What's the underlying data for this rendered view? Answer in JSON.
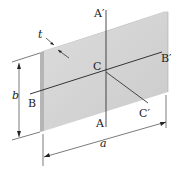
{
  "diagram": {
    "labels": {
      "a_prime": "A′",
      "a": "A",
      "b_prime": "B′",
      "b_axis": "B",
      "c": "C",
      "c_prime": "C′",
      "thickness": "t",
      "height_dim": "b",
      "width_dim": "a"
    },
    "colors": {
      "plate_face": "#d4d4d4",
      "plate_edge": "#b8b8b8",
      "line": "#222222"
    }
  }
}
